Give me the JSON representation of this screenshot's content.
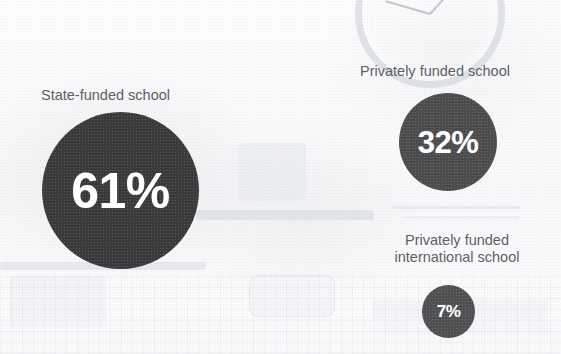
{
  "chart_data": {
    "type": "pie",
    "title": "",
    "subtitle": "",
    "xlabel": "",
    "ylabel": "",
    "units": "percent",
    "legend_position": "none",
    "grid": false,
    "categories": [
      "State-funded school",
      "Privately funded school",
      "Privately funded international school"
    ],
    "values": [
      61,
      32,
      7
    ],
    "value_labels": [
      "61%",
      "32%",
      "7%"
    ]
  },
  "background": {
    "clock_icon": "clock-face",
    "tone": "#fbfbfc"
  },
  "bubbles": [
    {
      "id": "state",
      "label": "State-funded school",
      "value_label": "61%",
      "value": 61,
      "color": "#3a3a3c",
      "text_color": "#ffffff",
      "diameter_px": 157
    },
    {
      "id": "private",
      "label": "Privately funded school",
      "value_label": "32%",
      "value": 32,
      "color": "#4b4c4e",
      "text_color": "#ffffff",
      "diameter_px": 98
    },
    {
      "id": "intl",
      "label": "Privately funded\ninternational school",
      "value_label": "7%",
      "value": 7,
      "color": "#4f5052",
      "text_color": "#ffffff",
      "diameter_px": 53
    }
  ]
}
